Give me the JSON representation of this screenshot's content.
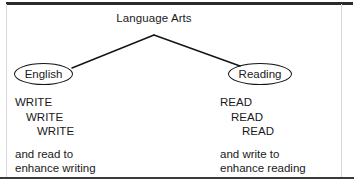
{
  "figure": {
    "root": {
      "label": "Language Arts"
    },
    "nodes": {
      "left": {
        "label": "English"
      },
      "right": {
        "label": "Reading"
      }
    },
    "columns": {
      "left": {
        "emphasis": [
          "WRITE",
          "WRITE",
          "WRITE"
        ],
        "tail": [
          "and read to",
          "enhance writing"
        ]
      },
      "right": {
        "emphasis": [
          "READ",
          "READ",
          "READ"
        ],
        "tail": [
          "and write to",
          "enhance reading"
        ]
      }
    },
    "colors": {
      "ink": "#1a1a1a",
      "stroke": "#151515",
      "rule": "#2b2b2b",
      "background": "#ffffff"
    }
  }
}
